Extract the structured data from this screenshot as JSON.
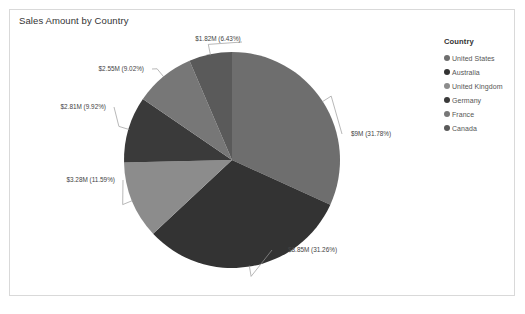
{
  "visual": {
    "title": "Sales Amount by Country",
    "background": "#ffffff",
    "border_color": "#d9d9d9"
  },
  "legend": {
    "title": "Country",
    "position": "right",
    "items": [
      {
        "label": "United States",
        "color": "#6e6e6e"
      },
      {
        "label": "Australia",
        "color": "#333333"
      },
      {
        "label": "United Kingdom",
        "color": "#8c8c8c"
      },
      {
        "label": "Germany",
        "color": "#3a3a3a"
      },
      {
        "label": "France",
        "color": "#777777"
      },
      {
        "label": "Canada",
        "color": "#5a5a5a"
      }
    ]
  },
  "chart_data": {
    "type": "pie",
    "title": "Sales Amount by Country",
    "xlabel": "",
    "ylabel": "",
    "legend_position": "right",
    "grid": false,
    "categories": [
      "United States",
      "Australia",
      "United Kingdom",
      "Germany",
      "France",
      "Canada"
    ],
    "values": [
      9.0,
      8.85,
      3.28,
      2.81,
      2.55,
      1.82
    ],
    "percents": [
      31.78,
      31.26,
      11.59,
      9.92,
      9.02,
      6.43
    ],
    "value_unit": "$M",
    "colors": [
      "#6e6e6e",
      "#333333",
      "#8c8c8c",
      "#3a3a3a",
      "#777777",
      "#5a5a5a"
    ],
    "data_labels": [
      {
        "text": "$9M (31.78%)",
        "category": "United States"
      },
      {
        "text": "$8.85M (31.26%)",
        "category": "Australia"
      },
      {
        "text": "$3.28M (11.59%)",
        "category": "United Kingdom"
      },
      {
        "text": "$2.81M (9.92%)",
        "category": "Germany"
      },
      {
        "text": "$2.55M (9.02%)",
        "category": "France"
      },
      {
        "text": "$1.82M (6.43%)",
        "category": "Canada"
      }
    ]
  },
  "labels": {
    "united_states": "$9M (31.78%)",
    "australia": "$8.85M (31.26%)",
    "united_kingdom": "$3.28M (11.59%)",
    "germany": "$2.81M (9.92%)",
    "france": "$2.55M (9.02%)",
    "canada": "$1.82M (6.43%)"
  }
}
